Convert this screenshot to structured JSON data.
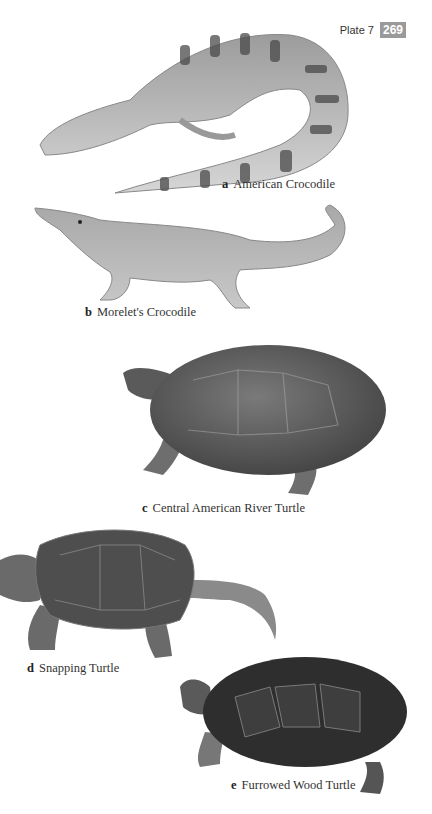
{
  "header": {
    "plate_label": "Plate 7",
    "page_number": "269",
    "badge_color": "#9a9a9a"
  },
  "species": [
    {
      "letter": "a",
      "name": "American Crocodile",
      "illustration": "crocodile-icon"
    },
    {
      "letter": "b",
      "name": "Morelet's Crocodile",
      "illustration": "crocodile-icon"
    },
    {
      "letter": "c",
      "name": "Central American River Turtle",
      "illustration": "turtle-icon"
    },
    {
      "letter": "d",
      "name": "Snapping Turtle",
      "illustration": "turtle-icon"
    },
    {
      "letter": "e",
      "name": "Furrowed Wood Turtle",
      "illustration": "turtle-icon"
    }
  ]
}
